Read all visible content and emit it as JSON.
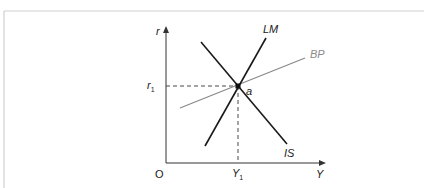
{
  "diagram": {
    "axes": {
      "y_label": "r",
      "x_label": "Y",
      "origin_label": "O"
    },
    "curves": [
      {
        "id": "LM",
        "label": "LM",
        "color": "#1a1a1a"
      },
      {
        "id": "IS",
        "label": "IS",
        "color": "#1a1a1a"
      },
      {
        "id": "BP",
        "label": "BP",
        "color": "#8a8a8a"
      }
    ],
    "equilibrium": {
      "point_label": "a",
      "r_label": "r",
      "r_subscript": "1",
      "y_label": "Y",
      "y_subscript": "1"
    },
    "colors": {
      "frame": "#cccccc",
      "axis": "#333333",
      "curve": "#1a1a1a",
      "bp_curve": "#8a8a8a",
      "dashed": "#333333"
    }
  }
}
